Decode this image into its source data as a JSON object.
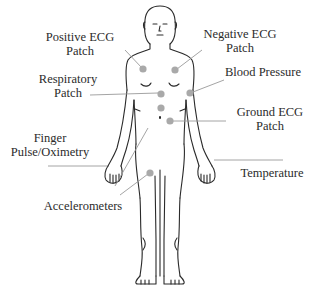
{
  "diagram": {
    "type": "annotated-body-diagram",
    "labels": {
      "positive_ecg": {
        "line1": "Positive ECG",
        "line2": "Patch"
      },
      "negative_ecg": {
        "line1": "Negative ECG",
        "line2": "Patch"
      },
      "respiratory": {
        "line1": "Respiratory",
        "line2": "Patch"
      },
      "blood_pressure": {
        "line1": "Blood Pressure"
      },
      "ground_ecg": {
        "line1": "Ground ECG",
        "line2": "Patch"
      },
      "finger": {
        "line1": "Finger",
        "line2": "Pulse/Oximetry"
      },
      "temperature": {
        "line1": "Temperature"
      },
      "accelerometers": {
        "line1": "Accelerometers"
      }
    },
    "colors": {
      "sensor_dot": "#a9a9a9",
      "leader_line": "#9a9a9a",
      "outline": "#2a2a2a"
    }
  }
}
